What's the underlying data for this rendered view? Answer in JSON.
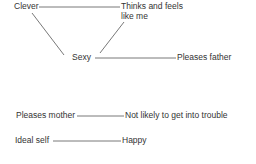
{
  "diagram": {
    "nodes": {
      "clever": "Clever",
      "thinks_1": "Thinks and feels",
      "thinks_2": "like me",
      "sexy": "Sexy",
      "pleases_father": "Pleases father",
      "pleases_mother": "Pleases mother",
      "not_likely": "Not likely to get into trouble",
      "ideal_self": "Ideal self",
      "happy": "Happy"
    },
    "edges": [
      [
        "Clever",
        "Thinks and feels like me"
      ],
      [
        "Clever",
        "Sexy"
      ],
      [
        "Sexy",
        "Thinks and feels like me"
      ],
      [
        "Sexy",
        "Pleases father"
      ],
      [
        "Pleases mother",
        "Not likely to get into trouble"
      ],
      [
        "Ideal self",
        "Happy"
      ]
    ],
    "line_color": "#555555",
    "text_color": "#333333"
  }
}
